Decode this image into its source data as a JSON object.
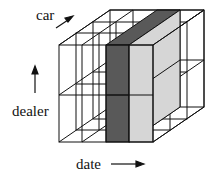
{
  "diagram": {
    "type": "data-cube",
    "axes": {
      "x": {
        "label": "date",
        "direction": "right"
      },
      "y": {
        "label": "dealer",
        "direction": "up"
      },
      "z": {
        "label": "car",
        "direction": "depth"
      }
    },
    "grid": {
      "x_cells": 4,
      "y_cells": 2,
      "z_cells": 3
    },
    "highlight": {
      "slice_dark_color": "#595959",
      "slice_light_color": "#d6d6d6",
      "description": "date slice highlighted (dark front, light side)"
    }
  },
  "labels": {
    "car": "car",
    "dealer": "dealer",
    "date": "date"
  }
}
